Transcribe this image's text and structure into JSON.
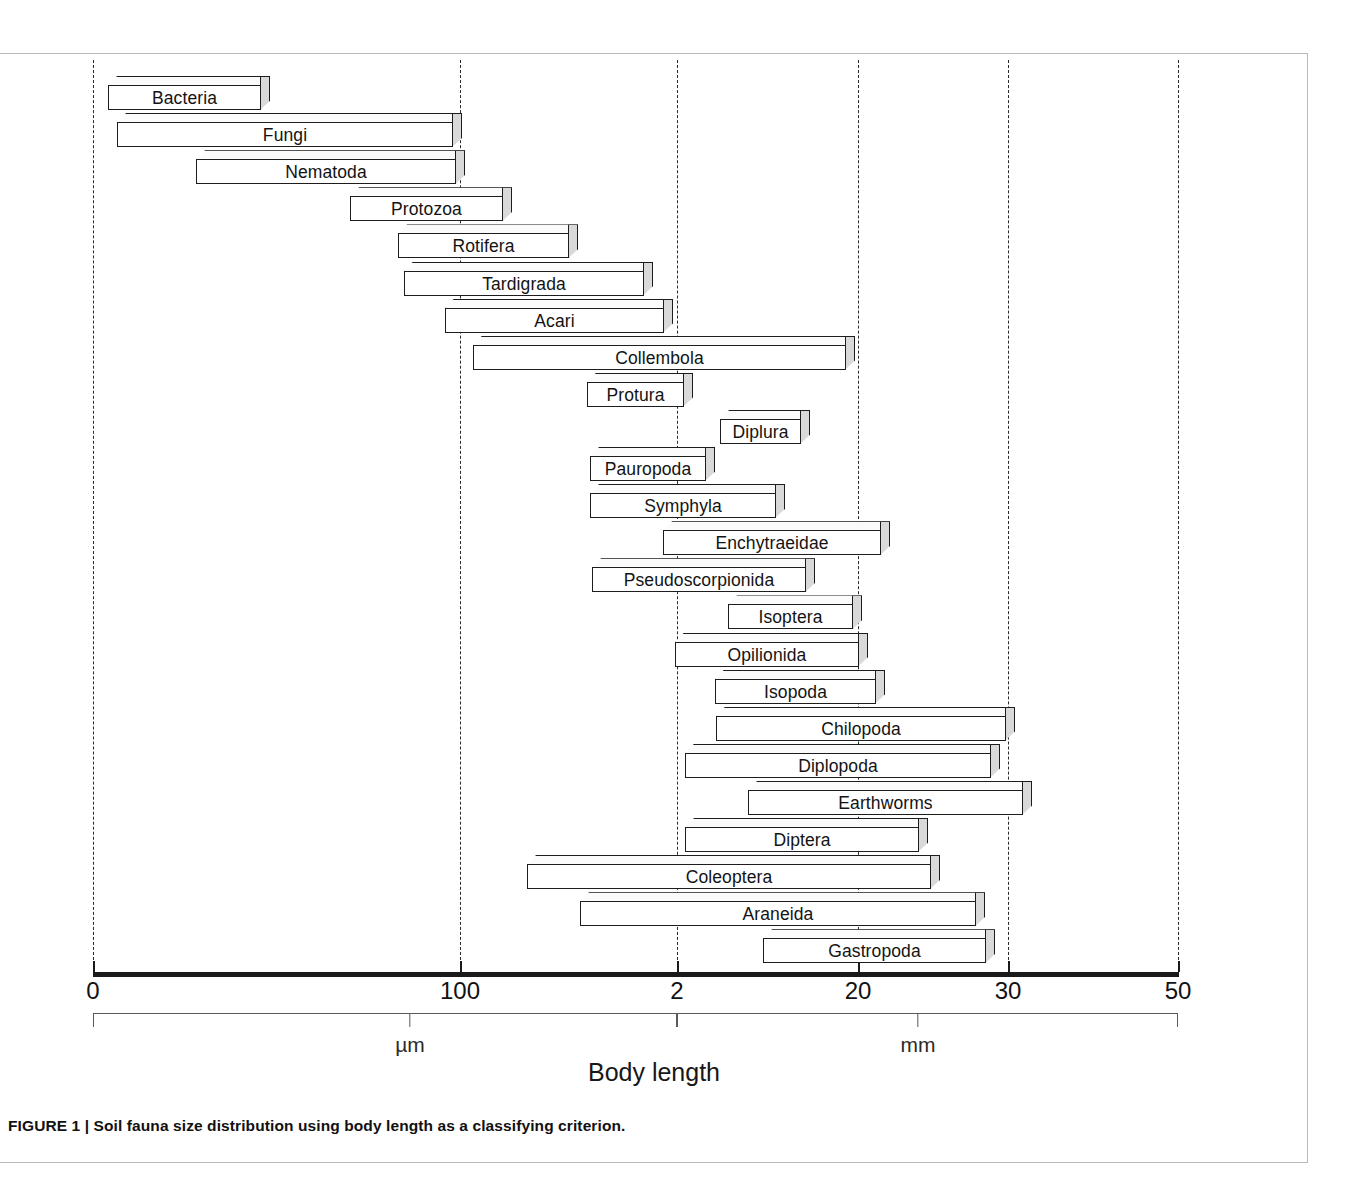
{
  "figure": {
    "caption": "FIGURE 1 | Soil fauna size distribution using body length as a classifying criterion."
  },
  "chart_data": {
    "type": "bar",
    "orientation": "horizontal",
    "title": "Soil fauna size distribution using body length as a classifying criterion.",
    "xlabel": "Body length",
    "ylabel": "",
    "grid": true,
    "legend": null,
    "note": "Horizontal floating range bars (3-D look). Axis is piecewise: micrometre segment 0-100 um then millimetre segment 2-50 mm. x values below are recorded in pixel-space tick units matching the drawn axis.",
    "axis_ticks": [
      {
        "label": "0",
        "x_px": 93
      },
      {
        "label": "100",
        "x_px": 460
      },
      {
        "label": "2",
        "x_px": 677
      },
      {
        "label": "20",
        "x_px": 858
      },
      {
        "label": "30",
        "x_px": 1008
      },
      {
        "label": "50",
        "x_px": 1178
      }
    ],
    "gridlines_px": [
      93,
      460,
      677,
      858,
      1008,
      1178
    ],
    "unit_brackets": [
      {
        "unit": "µm",
        "start_px": 93,
        "end_px": 677,
        "mid_px": 410
      },
      {
        "unit": "mm",
        "start_px": 677,
        "end_px": 1178,
        "mid_px": 918
      }
    ],
    "categories": [
      "Bacteria",
      "Fungi",
      "Nematoda",
      "Protozoa",
      "Rotifera",
      "Tardigrada",
      "Acari",
      "Collembola",
      "Protura",
      "Diplura",
      "Pauropoda",
      "Symphyla",
      "Enchytraeidae",
      "Pseudoscorpionida",
      "Isoptera",
      "Opilionida",
      "Isopoda",
      "Chilopoda",
      "Diplopoda",
      "Earthworms",
      "Diptera",
      "Coleoptera",
      "Araneida",
      "Gastropoda"
    ],
    "bars": [
      {
        "label": "Bacteria",
        "start_px": 108,
        "end_px": 270,
        "row": 0
      },
      {
        "label": "Fungi",
        "start_px": 117,
        "end_px": 462,
        "row": 1
      },
      {
        "label": "Nematoda",
        "start_px": 196,
        "end_px": 465,
        "row": 2
      },
      {
        "label": "Protozoa",
        "start_px": 350,
        "end_px": 512,
        "row": 3
      },
      {
        "label": "Rotifera",
        "start_px": 398,
        "end_px": 578,
        "row": 4
      },
      {
        "label": "Tardigrada",
        "start_px": 404,
        "end_px": 653,
        "row": 5
      },
      {
        "label": "Acari",
        "start_px": 445,
        "end_px": 673,
        "row": 6
      },
      {
        "label": "Collembola",
        "start_px": 473,
        "end_px": 855,
        "row": 7
      },
      {
        "label": "Protura",
        "start_px": 587,
        "end_px": 693,
        "row": 8
      },
      {
        "label": "Diplura",
        "start_px": 720,
        "end_px": 810,
        "row": 9
      },
      {
        "label": "Pauropoda",
        "start_px": 590,
        "end_px": 715,
        "row": 10
      },
      {
        "label": "Symphyla",
        "start_px": 590,
        "end_px": 785,
        "row": 11
      },
      {
        "label": "Enchytraeidae",
        "start_px": 663,
        "end_px": 890,
        "row": 12
      },
      {
        "label": "Pseudoscorpionida",
        "start_px": 592,
        "end_px": 815,
        "row": 13
      },
      {
        "label": "Isoptera",
        "start_px": 728,
        "end_px": 862,
        "row": 14
      },
      {
        "label": "Opilionida",
        "start_px": 675,
        "end_px": 868,
        "row": 15
      },
      {
        "label": "Isopoda",
        "start_px": 715,
        "end_px": 885,
        "row": 16
      },
      {
        "label": "Chilopoda",
        "start_px": 716,
        "end_px": 1015,
        "row": 17
      },
      {
        "label": "Diplopoda",
        "start_px": 685,
        "end_px": 1000,
        "row": 18
      },
      {
        "label": "Earthworms",
        "start_px": 748,
        "end_px": 1032,
        "row": 19
      },
      {
        "label": "Diptera",
        "start_px": 685,
        "end_px": 928,
        "row": 20
      },
      {
        "label": "Coleoptera",
        "start_px": 527,
        "end_px": 940,
        "row": 21
      },
      {
        "label": "Araneida",
        "start_px": 580,
        "end_px": 985,
        "row": 22
      },
      {
        "label": "Gastropoda",
        "start_px": 763,
        "end_px": 995,
        "row": 23
      }
    ]
  },
  "axis": {
    "title": "Body length"
  },
  "colors": {
    "bar_face": "#ffffff",
    "bar_side": "#d9d9d9",
    "bar_stroke": "#1d1d1d",
    "gridline": "#2a2a2a",
    "axis": "#1a1a1a",
    "frame": "#b9b9b9"
  }
}
